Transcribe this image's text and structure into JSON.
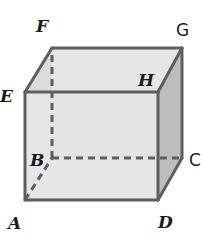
{
  "diagram": {
    "type": "rectangular prism / cube",
    "colors": {
      "front_face": "#e2e2e2",
      "top_face": "#dcdcdc",
      "right_face": "#bdbdbd",
      "edge": "#5e5e5e",
      "label": "#1a1a1a"
    },
    "vertices": {
      "A": {
        "label": "A",
        "x": 25,
        "y": 200
      },
      "B": {
        "label": "B",
        "x": 52,
        "y": 158
      },
      "C": {
        "label": "C",
        "x": 182,
        "y": 158
      },
      "D": {
        "label": "D",
        "x": 158,
        "y": 200
      },
      "E": {
        "label": "E",
        "x": 25,
        "y": 92
      },
      "F": {
        "label": "F",
        "x": 52,
        "y": 48
      },
      "G": {
        "label": "G",
        "x": 182,
        "y": 48
      },
      "H": {
        "label": "H",
        "x": 158,
        "y": 92
      }
    },
    "visible_edges": [
      "AD",
      "AE",
      "EH",
      "DH",
      "EF",
      "FG",
      "GH",
      "GC",
      "CD"
    ],
    "hidden_edges": [
      "AB",
      "BC",
      "BF"
    ]
  }
}
